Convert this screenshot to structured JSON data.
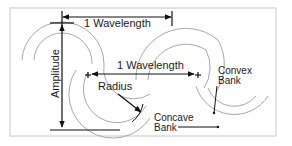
{
  "diagram": {
    "labels": {
      "wavelength_top": "1 Wavelength",
      "wavelength_mid": "1 Wavelength",
      "amplitude": "Amplitude",
      "radius": "Radius",
      "convex_bank": [
        "Convex",
        "Bank"
      ],
      "concave_bank": [
        "Concave",
        "Bank"
      ]
    },
    "colors": {
      "channel_lines": "#a8a8a8",
      "annotation_lines": "#111111",
      "frame": "#c8c8c8",
      "text": "#1a1a1a"
    }
  }
}
